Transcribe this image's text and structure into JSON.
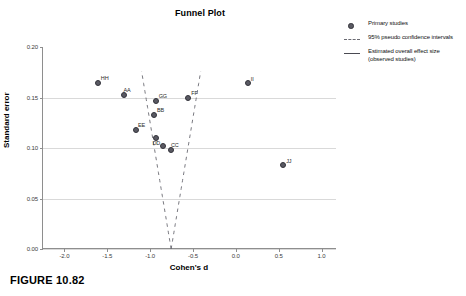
{
  "figure": {
    "caption": "FIGURE 10.82"
  },
  "chart_data": {
    "type": "scatter",
    "title": "Funnel Plot",
    "xlabel": "Cohen's d",
    "ylabel": "Standard error",
    "xlim": [
      -2.25,
      1.18
    ],
    "ylim": [
      0.2,
      0.0
    ],
    "y_inverted": true,
    "grid": "horizontal",
    "xticks": [
      "-2.0",
      "-1.5",
      "-1.0",
      "-0.5",
      "0.0",
      "0.5",
      "1.0"
    ],
    "xtick_values": [
      -2.0,
      -1.5,
      -1.0,
      -0.5,
      0.0,
      0.5,
      1.0
    ],
    "yticks": [
      "0.00",
      "0.05",
      "0.10",
      "0.15",
      "0.20"
    ],
    "ytick_values": [
      0.0,
      0.05,
      0.1,
      0.15,
      0.2
    ],
    "effect_size": -0.755,
    "ci_multiplier": 1.96,
    "points": [
      {
        "label": "AA",
        "x": -1.3,
        "y": 0.1525,
        "label_dx": -1,
        "label_dy": -8
      },
      {
        "label": "BB",
        "x": -0.955,
        "y": 0.1325,
        "label_dx": 3,
        "label_dy": -8
      },
      {
        "label": "CC",
        "x": -0.757,
        "y": 0.0985,
        "label_dx": 0,
        "label_dy": -8
      },
      {
        "label": "DD",
        "x": -0.845,
        "y": 0.1015,
        "label_dx": -11,
        "label_dy": -6
      },
      {
        "label": "EE",
        "x": -1.165,
        "y": 0.1175,
        "label_dx": 2,
        "label_dy": -8
      },
      {
        "label": "FF",
        "x": -0.555,
        "y": 0.1495,
        "label_dx": 3,
        "label_dy": -8
      },
      {
        "label": "GG",
        "x": -0.935,
        "y": 0.1465,
        "label_dx": 3,
        "label_dy": -8
      },
      {
        "label": "HH",
        "x": -1.61,
        "y": 0.164,
        "label_dx": 3,
        "label_dy": -8
      },
      {
        "label": "II",
        "x": 0.14,
        "y": 0.1645,
        "label_dx": 3,
        "label_dy": -7
      },
      {
        "label": "JJ",
        "x": 0.552,
        "y": 0.0835,
        "label_dx": 3,
        "label_dy": -7
      },
      {
        "label": "",
        "x": -0.93,
        "y": 0.11,
        "label_dx": 0,
        "label_dy": 0
      }
    ],
    "legend": {
      "position": "top-right",
      "entries": [
        {
          "key": "dot",
          "label": "Primary studies"
        },
        {
          "key": "dash",
          "label": "95% pseudo confidence intervals"
        },
        {
          "key": "solid",
          "label": "Estimated overall effect size (observed studies)"
        }
      ]
    }
  },
  "colors": {
    "point_fill": "#5a5a63",
    "point_stroke": "#33333a",
    "grid": "#d9d9d9",
    "axis": "#8e8e8e",
    "effect_line": "#55555f",
    "ci_line": "#6a6a72"
  }
}
